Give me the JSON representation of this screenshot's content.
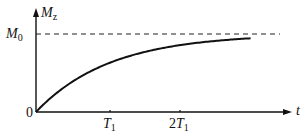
{
  "chart_data": {
    "type": "line",
    "title": "",
    "xlabel": "t",
    "ylabel": "M_z",
    "x_ticks": [
      "T1",
      "2T1"
    ],
    "y_ticks": [
      "M0"
    ],
    "origin_label": "0",
    "asymptote": {
      "label": "M0",
      "style": "dashed",
      "value": 1.0
    },
    "series": [
      {
        "name": "M_z(t) = M0(1 - e^(-t/T1))",
        "x": [
          0,
          0.25,
          0.5,
          0.75,
          1.0,
          1.25,
          1.5,
          1.75,
          2.0,
          2.25,
          2.5,
          2.75,
          3.0
        ],
        "values": [
          0,
          0.221,
          0.393,
          0.528,
          0.632,
          0.713,
          0.777,
          0.826,
          0.865,
          0.895,
          0.918,
          0.936,
          0.95
        ]
      }
    ],
    "xlim": [
      0,
      3.4
    ],
    "ylim": [
      0,
      1.3
    ],
    "grid": false,
    "legend": "none"
  },
  "labels": {
    "y_axis_main": "M",
    "y_axis_sub": "z",
    "m0_main": "M",
    "m0_sub": "0",
    "origin": "0",
    "t1_main": "T",
    "t1_sub": "1",
    "t2_prefix": "2",
    "t2_main": "T",
    "t2_sub": "1",
    "x_axis": "t"
  },
  "colors": {
    "curve": "#111111",
    "axes": "#111111",
    "dashed": "#222222"
  }
}
